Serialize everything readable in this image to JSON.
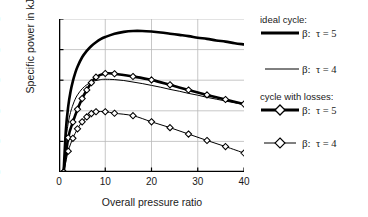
{
  "chart_data": {
    "type": "line",
    "title": "",
    "xlabel": "Overall pressure ratio",
    "ylabel": "Specific power in kJ/kg",
    "xlim": [
      0,
      40
    ],
    "ylim": [
      0,
      500
    ],
    "xticks": [
      0,
      10,
      20,
      30,
      40
    ],
    "yticks": [
      0,
      100,
      200,
      300,
      400,
      500
    ],
    "grid": true,
    "legend_position": "right",
    "series": [
      {
        "name": "ideal cycle, beta, tau = 5",
        "style": "thick-solid",
        "marker": "none",
        "color": "#000000",
        "x": [
          1,
          1.5,
          2,
          2.5,
          3,
          3.5,
          4,
          5,
          6,
          7,
          8,
          9,
          10,
          12,
          14,
          16,
          18,
          20,
          22,
          24,
          26,
          28,
          30,
          32,
          34,
          36,
          38,
          40
        ],
        "y": [
          0,
          140,
          215,
          263,
          297,
          323,
          344,
          375,
          396,
          412,
          424,
          434,
          441,
          452,
          458,
          461,
          461,
          459,
          456,
          452,
          448,
          444,
          439,
          435,
          430,
          426,
          421,
          417
        ]
      },
      {
        "name": "ideal cycle, beta, tau = 4",
        "style": "thin-solid",
        "marker": "none",
        "color": "#000000",
        "x": [
          1,
          1.5,
          2,
          2.5,
          3,
          3.5,
          4,
          5,
          6,
          7,
          8,
          9,
          10,
          12,
          14,
          16,
          18,
          20,
          22,
          24,
          26,
          28,
          30,
          32,
          34,
          36,
          38,
          40
        ],
        "y": [
          0,
          105,
          160,
          195,
          219,
          238,
          252,
          272,
          285,
          294,
          299,
          302,
          303,
          302,
          299,
          294,
          289,
          283,
          277,
          270,
          264,
          257,
          251,
          244,
          238,
          232,
          226,
          220
        ]
      },
      {
        "name": "cycle with losses, beta, tau = 5",
        "style": "thick-solid",
        "marker": "diamond",
        "color": "#000000",
        "x": [
          1,
          2,
          3,
          4,
          5,
          6,
          7,
          8,
          10,
          12,
          16,
          20,
          24,
          28,
          32,
          36,
          40
        ],
        "y": [
          0,
          112,
          163,
          205,
          240,
          268,
          292,
          310,
          322,
          321,
          312,
          301,
          285,
          268,
          252,
          237,
          222
        ]
      },
      {
        "name": "cycle with losses, beta, tau = 4",
        "style": "thin-solid",
        "marker": "diamond",
        "color": "#000000",
        "x": [
          1,
          2,
          3,
          4,
          5,
          6,
          7,
          8,
          10,
          12,
          16,
          20,
          24,
          28,
          32,
          36,
          40
        ],
        "y": [
          0,
          68,
          110,
          141,
          164,
          180,
          191,
          197,
          197,
          192,
          184,
          164,
          145,
          124,
          103,
          83,
          62
        ]
      }
    ]
  },
  "axes": {
    "ylabel": "Specific power in kJ/kg",
    "xlabel": "Overall pressure ratio",
    "ytick_labels": [
      "0",
      "100",
      "200",
      "300",
      "400",
      "500"
    ],
    "xtick_labels": [
      "0",
      "10",
      "20",
      "30",
      "40"
    ]
  },
  "legend": {
    "heading_ideal": "ideal cycle:",
    "heading_losses": "cycle with losses:",
    "entries": [
      {
        "beta": "β:",
        "tau": "τ = 5",
        "group": "ideal",
        "marker": "none",
        "weight": "thick"
      },
      {
        "beta": "β:",
        "tau": "τ = 4",
        "group": "ideal",
        "marker": "none",
        "weight": "thin"
      },
      {
        "beta": "β:",
        "tau": "τ = 5",
        "group": "losses",
        "marker": "diamond",
        "weight": "thick"
      },
      {
        "beta": "β:",
        "tau": "τ = 4",
        "group": "losses",
        "marker": "diamond",
        "weight": "thin"
      }
    ]
  },
  "colors": {
    "ink": "#000000",
    "grid": "#b9b9b9",
    "background": "#ffffff"
  }
}
